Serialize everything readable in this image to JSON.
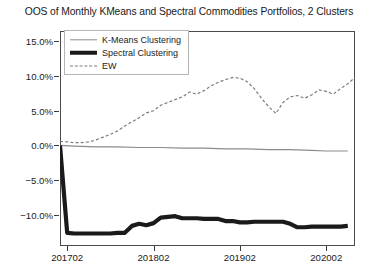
{
  "chart_data": {
    "type": "line",
    "title": "OOS of Monthly KMeans and Spectral Commodities Portfolios, 2 Clusters",
    "xlabel": "",
    "ylabel": "",
    "grid": false,
    "legend_position": "upper left",
    "xlim": [
      201701,
      202006
    ],
    "ylim": [
      -0.145,
      0.165
    ],
    "yticks": [
      "15.0%",
      "10.0%",
      "5.0%",
      "0.0%",
      "-5.0%",
      "-10.0%"
    ],
    "ytick_values": [
      0.15,
      0.1,
      0.05,
      0.0,
      -0.05,
      -0.1
    ],
    "xticks": [
      "201702",
      "201802",
      "201902",
      "202002"
    ],
    "xtick_values": [
      201702,
      201802,
      201902,
      202002
    ],
    "series": [
      {
        "name": "K-Means Clustering",
        "style": "solid-thin",
        "color": "#8c8c8c",
        "x": [
          201701,
          201703,
          201706,
          201709,
          201712,
          201803,
          201806,
          201809,
          201812,
          201903,
          201906,
          201909,
          201912,
          202002,
          202003,
          202004,
          202005
        ],
        "values": [
          0.0,
          -0.001,
          -0.002,
          -0.002,
          -0.003,
          -0.003,
          -0.004,
          -0.004,
          -0.005,
          -0.005,
          -0.006,
          -0.006,
          -0.007,
          -0.008,
          -0.008,
          -0.008,
          -0.008
        ]
      },
      {
        "name": "Spectral Clustering",
        "style": "solid-thick",
        "color": "#1a1a1a",
        "x": [
          201701,
          201702,
          201703,
          201704,
          201705,
          201706,
          201707,
          201708,
          201709,
          201710,
          201711,
          201712,
          201801,
          201802,
          201803,
          201804,
          201805,
          201806,
          201807,
          201808,
          201809,
          201810,
          201811,
          201812,
          201901,
          201902,
          201903,
          201904,
          201905,
          201906,
          201907,
          201908,
          201909,
          201910,
          201911,
          201912,
          202001,
          202002,
          202003,
          202004,
          202005
        ],
        "values": [
          0.0,
          -0.126,
          -0.127,
          -0.127,
          -0.127,
          -0.127,
          -0.127,
          -0.127,
          -0.126,
          -0.126,
          -0.116,
          -0.113,
          -0.115,
          -0.112,
          -0.104,
          -0.103,
          -0.102,
          -0.105,
          -0.105,
          -0.105,
          -0.106,
          -0.106,
          -0.106,
          -0.109,
          -0.109,
          -0.111,
          -0.111,
          -0.11,
          -0.11,
          -0.11,
          -0.11,
          -0.11,
          -0.113,
          -0.118,
          -0.118,
          -0.117,
          -0.117,
          -0.117,
          -0.117,
          -0.117,
          -0.116
        ]
      },
      {
        "name": "EW",
        "style": "dashed",
        "color": "#7d7d7d",
        "x": [
          201701,
          201702,
          201703,
          201704,
          201705,
          201706,
          201707,
          201708,
          201709,
          201710,
          201711,
          201712,
          201801,
          201802,
          201803,
          201804,
          201805,
          201806,
          201807,
          201808,
          201809,
          201810,
          201811,
          201812,
          201901,
          201902,
          201903,
          201904,
          201905,
          201906,
          201907,
          201908,
          201909,
          201910,
          201911,
          201912,
          202001,
          202002,
          202003,
          202004,
          202005
        ],
        "values": [
          0.006,
          0.005,
          0.004,
          0.004,
          0.005,
          0.008,
          0.012,
          0.016,
          0.021,
          0.028,
          0.034,
          0.04,
          0.047,
          0.05,
          0.058,
          0.062,
          0.066,
          0.07,
          0.077,
          0.074,
          0.079,
          0.086,
          0.091,
          0.095,
          0.098,
          0.097,
          0.092,
          0.082,
          0.068,
          0.056,
          0.046,
          0.062,
          0.07,
          0.072,
          0.068,
          0.073,
          0.08,
          0.078,
          0.074,
          0.082,
          0.089
        ]
      }
    ],
    "series_extra_ew": {
      "x": [
        202006,
        202007,
        202008,
        202009,
        202010,
        202011,
        202012
      ],
      "values": [
        0.098,
        0.11,
        0.122,
        0.138,
        0.145,
        0.128,
        0.1
      ]
    }
  },
  "legend": {
    "items": [
      {
        "label": "K-Means Clustering",
        "swatch": "solid-thin-line-swatch"
      },
      {
        "label": "Spectral Clustering",
        "swatch": "solid-thick-line-swatch"
      },
      {
        "label": "EW",
        "swatch": "dashed-line-swatch"
      }
    ]
  }
}
